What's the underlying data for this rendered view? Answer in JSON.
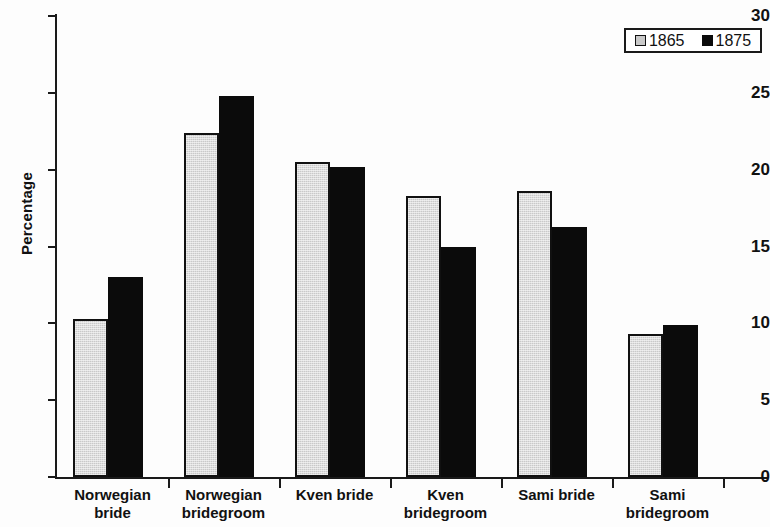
{
  "chart_data": {
    "type": "bar",
    "title": "",
    "xlabel": "",
    "ylabel": "Percentage",
    "ylim": [
      0,
      30
    ],
    "yticks": [
      0,
      5,
      10,
      15,
      20,
      25,
      30
    ],
    "grid": false,
    "legend_position": "top-right",
    "categories": [
      "Norwegian bride",
      "Norwegian bridegroom",
      "Kven bride",
      "Kven bridegroom",
      "Sami bride",
      "Sami bridegroom"
    ],
    "category_lines": [
      [
        "Norwegian",
        "bride"
      ],
      [
        "Norwegian",
        "bridegroom"
      ],
      [
        "Kven bride",
        ""
      ],
      [
        "Kven",
        "bridegroom"
      ],
      [
        "Sami bride",
        ""
      ],
      [
        "Sami",
        "bridegroom"
      ]
    ],
    "series": [
      {
        "name": "1865",
        "color": "#c9c9c9",
        "values": [
          10.3,
          22.4,
          20.5,
          18.3,
          18.6,
          9.3
        ]
      },
      {
        "name": "1875",
        "color": "#0b0b0b",
        "values": [
          13.0,
          24.8,
          20.2,
          15.0,
          16.3,
          9.9
        ]
      }
    ]
  },
  "legend": {
    "entries": [
      {
        "label": "1865",
        "swatch": "light-gray-square"
      },
      {
        "label": "1875",
        "swatch": "black-square"
      }
    ]
  },
  "axes": {
    "y_label": "Percentage",
    "y_tick_labels": [
      "30",
      "25",
      "20",
      "15",
      "10",
      "5",
      "0"
    ]
  }
}
